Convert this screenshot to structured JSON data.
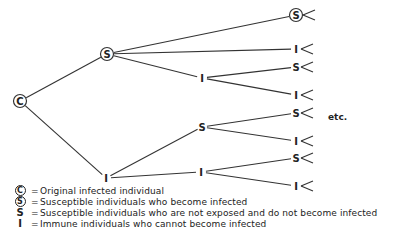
{
  "diagram": {
    "type": "tree",
    "nodes": [
      {
        "id": "C",
        "label": "C",
        "circled": true,
        "x": 20,
        "y": 101
      },
      {
        "id": "S1",
        "label": "S",
        "circled": true,
        "x": 107,
        "y": 54
      },
      {
        "id": "I1",
        "label": "I",
        "circled": false,
        "x": 106,
        "y": 178
      },
      {
        "id": "S2",
        "label": "S",
        "circled": true,
        "x": 296,
        "y": 15
      },
      {
        "id": "I2a",
        "label": "I",
        "circled": false,
        "x": 202,
        "y": 78
      },
      {
        "id": "S2b",
        "label": "S",
        "circled": false,
        "x": 202,
        "y": 127
      },
      {
        "id": "I2c",
        "label": "I",
        "circled": false,
        "x": 201,
        "y": 172
      },
      {
        "id": "I3a",
        "label": "I",
        "circled": false,
        "x": 296,
        "y": 49
      },
      {
        "id": "S3b",
        "label": "S",
        "circled": false,
        "x": 296,
        "y": 67
      },
      {
        "id": "I3c",
        "label": "I",
        "circled": false,
        "x": 296,
        "y": 95
      },
      {
        "id": "S3d",
        "label": "S",
        "circled": false,
        "x": 296,
        "y": 113
      },
      {
        "id": "I3e",
        "label": "I",
        "circled": false,
        "x": 296,
        "y": 141
      },
      {
        "id": "S3f",
        "label": "S",
        "circled": false,
        "x": 296,
        "y": 158
      },
      {
        "id": "I3g",
        "label": "I",
        "circled": false,
        "x": 296,
        "y": 186
      }
    ],
    "edges": [
      [
        "C",
        "S1"
      ],
      [
        "C",
        "I1"
      ],
      [
        "S1",
        "S2"
      ],
      [
        "S1",
        "I3a"
      ],
      [
        "S1",
        "I2a"
      ],
      [
        "I2a",
        "S3b"
      ],
      [
        "I2a",
        "I3c"
      ],
      [
        "I1",
        "S2b"
      ],
      [
        "I1",
        "I2c"
      ],
      [
        "S2b",
        "S3d"
      ],
      [
        "S2b",
        "I3e"
      ],
      [
        "I2c",
        "S3f"
      ],
      [
        "I2c",
        "I3g"
      ]
    ],
    "continuation_label": "etc."
  },
  "legend": [
    {
      "symbol": "C",
      "circled": true,
      "text": "Original infected individual"
    },
    {
      "symbol": "S",
      "circled": true,
      "text": "Susceptible individuals who become infected"
    },
    {
      "symbol": "S",
      "circled": false,
      "text": "Susceptible individuals who are not exposed and do not become infected"
    },
    {
      "symbol": "I",
      "circled": false,
      "text": "Immune individuals who cannot become infected"
    }
  ],
  "legend_separator": "="
}
